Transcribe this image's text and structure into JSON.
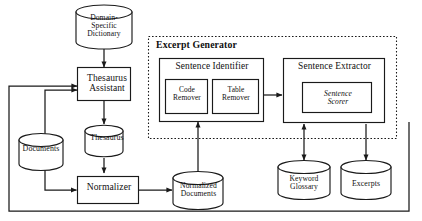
{
  "diagram": {
    "type": "dataflow-diagram",
    "background_color": "#ffffff",
    "stroke_color": "#1a1a1a"
  },
  "group": {
    "excerpt_generator": {
      "label": "Excerpt Generator",
      "border_style": "dashed"
    }
  },
  "processes": {
    "thesaurus_assistant": {
      "label": "Thesaurus\nAssistant"
    },
    "normalizer": {
      "label": "Normalizer"
    },
    "sentence_identifier": {
      "label": "Sentence Identifier"
    },
    "code_remover": {
      "label": "Code\nRemover"
    },
    "table_remover": {
      "label": "Table\nRemover"
    },
    "sentence_extractor": {
      "label": "Sentence Extractor"
    },
    "sentence_scorer": {
      "label": "Sentence\nScorer"
    }
  },
  "datastores": {
    "domain_specific_dictionary": {
      "label": "Domain-\nSpecific\nDictionary"
    },
    "documents": {
      "label": "Documents"
    },
    "thesaurus": {
      "label": "Thesaurus"
    },
    "normalized_documents": {
      "label": "Normalized\nDocuments"
    },
    "keyword_glossary": {
      "label": "Keyword\nGlossary"
    },
    "excerpts": {
      "label": "Excerpts"
    }
  },
  "flows": [
    {
      "from": "domain_specific_dictionary",
      "to": "thesaurus_assistant",
      "arrow": "single"
    },
    {
      "from": "documents",
      "to": "thesaurus_assistant",
      "arrow": "single"
    },
    {
      "from": "thesaurus_assistant",
      "to": "thesaurus",
      "arrow": "single"
    },
    {
      "from": "thesaurus",
      "to": "normalizer",
      "arrow": "single"
    },
    {
      "from": "documents",
      "to": "normalizer",
      "arrow": "single"
    },
    {
      "from": "normalizer",
      "to": "normalized_documents",
      "arrow": "single"
    },
    {
      "from": "normalized_documents",
      "to": "sentence_identifier",
      "arrow": "single"
    },
    {
      "from": "sentence_identifier",
      "to": "sentence_extractor",
      "arrow": "single"
    },
    {
      "from": "sentence_extractor",
      "to": "keyword_glossary",
      "arrow": "double"
    },
    {
      "from": "sentence_extractor",
      "to": "excerpts",
      "arrow": "single"
    },
    {
      "from": "sentence_extractor",
      "to": "thesaurus_assistant",
      "arrow": "single"
    }
  ]
}
